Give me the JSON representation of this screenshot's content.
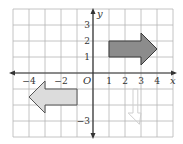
{
  "grid": {
    "x_min": -5,
    "x_max": 5,
    "y_min": -4,
    "y_max": 4,
    "unit_px": 16,
    "origin_px": [
      93,
      73
    ],
    "grid_color": "#b5b5b5",
    "axis_color": "#333333"
  },
  "axes": {
    "x_label": "x",
    "y_label": "y",
    "origin_label": "O",
    "x_ticks": [
      {
        "value": -4,
        "label": "−4"
      },
      {
        "value": -2,
        "label": "−2"
      },
      {
        "value": 1,
        "label": "1"
      },
      {
        "value": 2,
        "label": "2"
      },
      {
        "value": 3,
        "label": "3"
      },
      {
        "value": 4,
        "label": "4"
      }
    ],
    "y_ticks": [
      {
        "value": 3,
        "label": "3"
      },
      {
        "value": 2,
        "label": "2"
      },
      {
        "value": 1,
        "label": "1"
      },
      {
        "value": -3,
        "label": "−3"
      }
    ]
  },
  "shapes": [
    {
      "name": "dark-arrow-right",
      "fill": "#8c8c8c",
      "stroke": "#3a3a3a",
      "points": [
        [
          1,
          1
        ],
        [
          3,
          1
        ],
        [
          3,
          0.5
        ],
        [
          4,
          1.5
        ],
        [
          3,
          2.5
        ],
        [
          3,
          2
        ],
        [
          1,
          2
        ]
      ]
    },
    {
      "name": "light-arrow-left",
      "fill": "#dcdcdc",
      "stroke": "#555555",
      "points": [
        [
          -1,
          -1
        ],
        [
          -3,
          -1
        ],
        [
          -3,
          -0.5
        ],
        [
          -4,
          -1.5
        ],
        [
          -3,
          -2.5
        ],
        [
          -3,
          -2
        ],
        [
          -1,
          -2
        ]
      ]
    },
    {
      "name": "faint-arrow-down",
      "fill": "none",
      "stroke": "#cfcfcf",
      "points": [
        [
          2.5,
          -1
        ],
        [
          2.5,
          -2.5
        ],
        [
          2.2,
          -2.5
        ],
        [
          2.9,
          -3.2
        ],
        [
          3,
          -2.5
        ],
        [
          2.8,
          -2.5
        ],
        [
          2.8,
          -1
        ]
      ]
    }
  ]
}
